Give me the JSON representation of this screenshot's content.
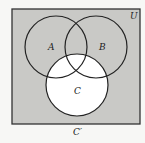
{
  "diagram": {
    "type": "venn",
    "universe_label": "U",
    "sets": [
      {
        "name": "A",
        "label": "A"
      },
      {
        "name": "B",
        "label": "B"
      },
      {
        "name": "C",
        "label": "C"
      }
    ],
    "shaded_region": "C'",
    "caption": "C′",
    "colors": {
      "shade": "#c9c9c6",
      "unshaded": "#ffffff",
      "stroke": "#222222"
    }
  }
}
